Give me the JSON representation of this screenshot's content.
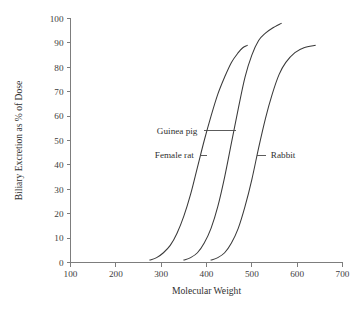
{
  "chart_data": {
    "type": "line",
    "title": "",
    "xlabel": "Molecular Weight",
    "ylabel": "Biliary Excretion as % of Dose",
    "xlim": [
      100,
      700
    ],
    "ylim": [
      0,
      100
    ],
    "xticks": [
      100,
      200,
      300,
      400,
      500,
      600,
      700
    ],
    "yticks": [
      0,
      10,
      20,
      30,
      40,
      50,
      60,
      70,
      80,
      90,
      100
    ],
    "grid": false,
    "legend_position": "inline-annotations",
    "series": [
      {
        "name": "Female rat",
        "color": "#3a3a3a",
        "points": [
          [
            275,
            1
          ],
          [
            290,
            2
          ],
          [
            305,
            4
          ],
          [
            320,
            7
          ],
          [
            335,
            12
          ],
          [
            350,
            19
          ],
          [
            365,
            28
          ],
          [
            380,
            39
          ],
          [
            395,
            50
          ],
          [
            410,
            60
          ],
          [
            425,
            69
          ],
          [
            440,
            76
          ],
          [
            455,
            82
          ],
          [
            470,
            86
          ],
          [
            480,
            88
          ],
          [
            490,
            89
          ]
        ]
      },
      {
        "name": "Guinea pig",
        "color": "#3a3a3a",
        "points": [
          [
            350,
            1
          ],
          [
            365,
            2
          ],
          [
            380,
            4
          ],
          [
            395,
            8
          ],
          [
            410,
            14
          ],
          [
            425,
            23
          ],
          [
            440,
            35
          ],
          [
            455,
            49
          ],
          [
            470,
            63
          ],
          [
            485,
            76
          ],
          [
            500,
            85
          ],
          [
            515,
            91
          ],
          [
            530,
            94
          ],
          [
            545,
            96
          ],
          [
            565,
            98
          ]
        ]
      },
      {
        "name": "Rabbit",
        "color": "#3a3a3a",
        "points": [
          [
            410,
            1
          ],
          [
            425,
            2
          ],
          [
            440,
            4
          ],
          [
            455,
            8
          ],
          [
            470,
            14
          ],
          [
            485,
            23
          ],
          [
            500,
            34
          ],
          [
            515,
            47
          ],
          [
            530,
            59
          ],
          [
            545,
            69
          ],
          [
            560,
            77
          ],
          [
            575,
            82
          ],
          [
            595,
            86
          ],
          [
            615,
            88
          ],
          [
            640,
            89
          ]
        ]
      }
    ],
    "annotations": [
      {
        "label": "Guinea pig",
        "target_series": "Guinea pig",
        "text_x": 380,
        "text_y": 54,
        "leader_from_x": 395,
        "leader_to_x": 465,
        "leader_y": 54
      },
      {
        "label": "Female rat",
        "target_series": "Female rat",
        "text_x": 372,
        "text_y": 44,
        "leader_from_x": 385,
        "leader_to_x": 402,
        "leader_y": 44
      },
      {
        "label": "Rabbit",
        "target_series": "Rabbit",
        "text_x": 542,
        "text_y": 44,
        "leader_from_x": 512,
        "leader_to_x": 532,
        "leader_y": 44
      }
    ]
  }
}
